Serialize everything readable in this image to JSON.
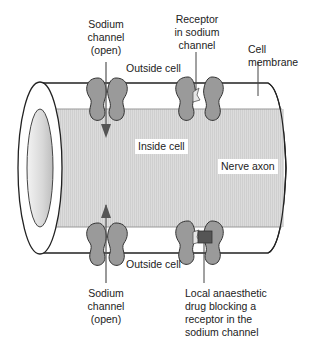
{
  "diagram": {
    "colors": {
      "axon_fill": "#d9d9d9",
      "channel_fill": "#9a9a9a",
      "receptor_fill": "#e6e6e6",
      "drug_fill": "#555555",
      "outline": "#222222",
      "arrow": "#555555"
    },
    "labels": {
      "sodium_channel_top": [
        "Sodium",
        "channel",
        "(open)"
      ],
      "receptor": [
        "Receptor",
        "in sodium",
        "channel"
      ],
      "cell_membrane": [
        "Cell",
        "membrane"
      ],
      "outside_cell_top": "Outside cell",
      "inside_cell": "Inside cell",
      "nerve_axon": "Nerve axon",
      "outside_cell_bottom": "Outside cell",
      "sodium_channel_bottom": [
        "Sodium",
        "channel",
        "(open)"
      ],
      "drug": [
        "Local anaesthetic",
        "drug blocking a",
        "receptor in the",
        "sodium channel"
      ]
    }
  }
}
